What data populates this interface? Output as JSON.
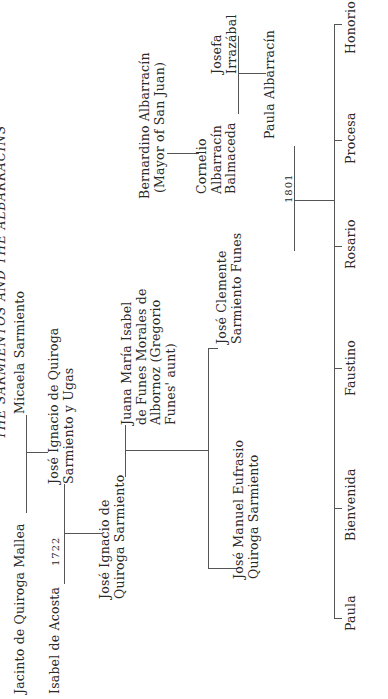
{
  "title": "THE SARMIENTOS AND THE ALBARRACINS",
  "people": {
    "jacinto": "Jacinto de Quiroga Mallea",
    "micaela": "Micaela Sarmiento",
    "isabel": "Isabel de Acosta",
    "jose_ignacio_ugas": [
      "José Ignacio de Quiroga",
      "Sarmiento y Ugas"
    ],
    "jose_ignacio_qs": [
      "José Ignacio de",
      "Quiroga Sarmiento"
    ],
    "juana": [
      "Juana María Isabel",
      "de Funes Morales de",
      "Albornoz (Gregorio",
      "Funes' aunt)"
    ],
    "jose_manuel": [
      "José Manuel Eufrasio",
      "Quiroga Sarmiento"
    ],
    "jose_clemente": [
      "José Clemente",
      "Sarmiento Funes"
    ],
    "bernardino": [
      "Bernardino Albarracín",
      "(Mayor of San Juan)"
    ],
    "cornelio": [
      "Cornelio",
      "Albarracín",
      "Balmaceda"
    ],
    "josefa": [
      "Josefa",
      "Irrazábal"
    ],
    "paula_albarracin": "Paula Albarracín"
  },
  "years": {
    "marriage_1722": "1722",
    "marriage_1801": "1801"
  },
  "children": [
    "Paula",
    "Bienvenida",
    "Faustino",
    "Rosario",
    "Procesa",
    "Honorio"
  ]
}
